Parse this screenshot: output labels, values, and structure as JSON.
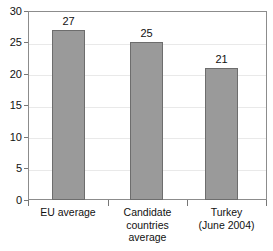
{
  "chart_data": {
    "type": "bar",
    "title": "",
    "subtitle": "",
    "xlabel": "",
    "ylabel": "",
    "categories": [
      "EU average",
      "Candidate countries average",
      "Turkey (June 2004)"
    ],
    "category_lines": [
      [
        "EU average"
      ],
      [
        "Candidate",
        "countries",
        "average"
      ],
      [
        "Turkey",
        "(June 2004)"
      ]
    ],
    "values": [
      27,
      25,
      21
    ],
    "value_labels": [
      "27",
      "25",
      "21"
    ],
    "ylim": [
      0,
      30
    ],
    "ytick_labels": [
      "30",
      "25",
      "20",
      "15",
      "10",
      "5",
      "0"
    ],
    "ytick_values": [
      30,
      25,
      20,
      15,
      10,
      5,
      0
    ],
    "grid": true,
    "grid_axis": "y",
    "legend": false,
    "legend_position": "none",
    "colors": {
      "bar_fill": "#9a9a9a",
      "bar_border": "#6d6d6d",
      "gridline": "#e9e9e9",
      "axis_border": "#8c8c8c",
      "tick_mark": "#777777",
      "text": "#111111",
      "background": "#ffffff"
    }
  }
}
